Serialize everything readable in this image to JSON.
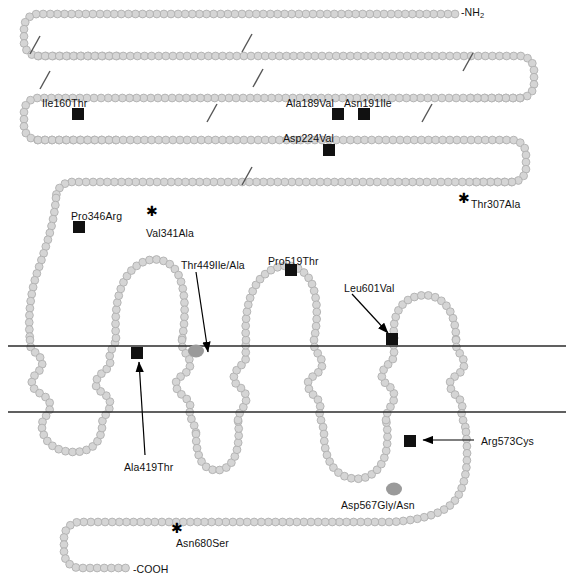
{
  "figure": {
    "type": "protein-topology-diagram",
    "terminus_n": "-NH",
    "terminus_n_sub": "2",
    "terminus_c": "-COOH",
    "colors": {
      "bead_fill": "#d5d5d5",
      "bead_stroke": "#b0b0b0",
      "mutation_square": "#111111",
      "mutation_blob": "#9a9a9a",
      "membrane_line": "#2b2b2b",
      "text": "#111111",
      "arrow": "#000000"
    },
    "membrane": {
      "outer_line_y": 346,
      "inner_line_y": 412
    }
  },
  "mutations": [
    {
      "id": "ile160thr",
      "label": "Ile160Thr",
      "marker": "black-square",
      "x": 42,
      "y": 98
    },
    {
      "id": "ala189val",
      "label": "Ala189Val",
      "marker": "black-square",
      "x": 286,
      "y": 98
    },
    {
      "id": "asn191ile",
      "label": "Asn191Ile",
      "marker": "black-square",
      "x": 344,
      "y": 98
    },
    {
      "id": "asp224val",
      "label": "Asp224Val",
      "marker": "black-square",
      "x": 283,
      "y": 133
    },
    {
      "id": "thr307ala",
      "label": "Thr307Ala",
      "marker": "star",
      "x": 471,
      "y": 199
    },
    {
      "id": "pro346arg",
      "label": "Pro346Arg",
      "marker": "black-square",
      "x": 71,
      "y": 211
    },
    {
      "id": "val341ala",
      "label": "Val341Ala",
      "marker": "star",
      "x": 146,
      "y": 228
    },
    {
      "id": "thr449ile_ala",
      "label": "Thr449Ile/Ala",
      "marker": "gray-blob",
      "x": 181,
      "y": 260
    },
    {
      "id": "pro519thr",
      "label": "Pro519Thr",
      "marker": "black-square",
      "x": 268,
      "y": 256
    },
    {
      "id": "leu601val",
      "label": "Leu601Val",
      "marker": "black-square",
      "x": 344,
      "y": 283
    },
    {
      "id": "ala419thr",
      "label": "Ala419Thr",
      "marker": "black-square",
      "x": 124,
      "y": 462
    },
    {
      "id": "arg573cys",
      "label": "Arg573Cys",
      "marker": "black-square",
      "x": 481,
      "y": 436
    },
    {
      "id": "asp567gly_asn",
      "label": "Asp567Gly/Asn",
      "marker": "gray-blob",
      "x": 341,
      "y": 500
    },
    {
      "id": "asn680ser",
      "label": "Asn680Ser",
      "marker": "star",
      "x": 176,
      "y": 538
    }
  ],
  "glycosylation_ticks": [
    {
      "id": "tick-1",
      "x": 35,
      "y": 45
    },
    {
      "id": "tick-2",
      "x": 247,
      "y": 43
    },
    {
      "id": "tick-3",
      "x": 468,
      "y": 62
    },
    {
      "id": "tick-4",
      "x": 45,
      "y": 80
    },
    {
      "id": "tick-5",
      "x": 258,
      "y": 78
    },
    {
      "id": "tick-6",
      "x": 212,
      "y": 113
    },
    {
      "id": "tick-7",
      "x": 427,
      "y": 113
    },
    {
      "id": "tick-8",
      "x": 247,
      "y": 176
    }
  ],
  "chart_data": {
    "type": "diagram",
    "labels": [
      "-NH2",
      "Ile160Thr",
      "Ala189Val",
      "Asn191Ile",
      "Asp224Val",
      "Thr307Ala",
      "Pro346Arg",
      "Val341Ala",
      "Thr449Ile/Ala",
      "Pro519Thr",
      "Leu601Val",
      "Ala419Thr",
      "Arg573Cys",
      "Asp567Gly/Asn",
      "Asn680Ser",
      "-COOH"
    ],
    "marker_types": {
      "black-square": "missense mutation",
      "gray-blob": "mutation at shaded residue",
      "star": "polymorphism / asterisk-marked residue"
    },
    "transmembrane_helices": 7,
    "membrane_bounds_y": [
      346,
      412
    ]
  }
}
